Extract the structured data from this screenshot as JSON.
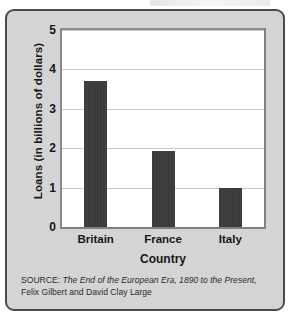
{
  "figure": {
    "background_color": "#d7d7d7",
    "border_color": "#4a4a4a",
    "plot_background_color": "#ffffff",
    "bar_color": "#3b3b3b",
    "gridline_color": "#c9c9c9"
  },
  "source": {
    "label": "SOURCE:",
    "title": "The End of the European Era, 1890 to the Present,",
    "authors": "Felix Gilbert and David Clay Large"
  },
  "chart_data": {
    "type": "bar",
    "title": "",
    "categories": [
      "Britain",
      "France",
      "Italy"
    ],
    "values": [
      3.7,
      1.93,
      0.98
    ],
    "xlabel": "Country",
    "ylabel": "Loans (in billions of dollars)",
    "ylim": [
      0,
      5
    ],
    "yticks": [
      0,
      1,
      2,
      3,
      4,
      5
    ],
    "ytick_labels": [
      "0",
      "1",
      "2",
      "3",
      "4",
      "5"
    ],
    "grid": true,
    "legend": false,
    "legend_position": "none",
    "bar_color": "#3b3b3b"
  }
}
